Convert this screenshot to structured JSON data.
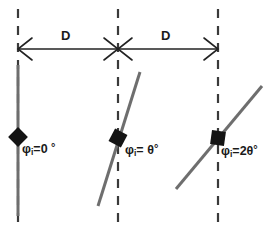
{
  "figure": {
    "background_color": "#ffffff",
    "width": 273,
    "height": 240
  },
  "colors": {
    "dashed_line": "#3a3a3a",
    "sample_line": "#6e6e6e",
    "marker": "#141414",
    "arrow": "#222222",
    "text": "#1a1a1a"
  },
  "dimension_arrows": [
    {
      "name": "left-span",
      "label": "D",
      "x1": 18,
      "x2": 118,
      "y": 49
    },
    {
      "name": "right-span",
      "label": "D",
      "x1": 118,
      "x2": 218,
      "y": 49
    }
  ],
  "reference_lines": [
    {
      "name": "reference-line-left",
      "x": 18
    },
    {
      "name": "reference-line-middle",
      "x": 118
    },
    {
      "name": "reference-line-right",
      "x": 218
    }
  ],
  "samples": [
    {
      "name": "sample-0",
      "symbol": "φ",
      "subscript": "i",
      "equals": "=",
      "value": "0",
      "degree": "°",
      "label_full": "φi=0 °",
      "angle_from_vertical_deg": 0,
      "marker": "diamond",
      "marker_x": 18,
      "marker_y": 137,
      "label_x": 22,
      "label_y": 143
    },
    {
      "name": "sample-theta",
      "symbol": "φ",
      "subscript": "i",
      "equals": "=",
      "value": "θ",
      "degree": "°",
      "label_full": "φi= θ°",
      "angle_from_vertical_deg": 17,
      "marker": "diamond",
      "marker_x": 118,
      "marker_y": 138,
      "label_x": 125,
      "label_y": 144
    },
    {
      "name": "sample-2theta",
      "symbol": "φ",
      "subscript": "i",
      "equals": "=",
      "value": "2θ",
      "degree": "°",
      "label_full": "φi=2θ°",
      "angle_from_vertical_deg": 40,
      "marker": "square",
      "marker_x": 218,
      "marker_y": 138,
      "label_x": 221,
      "label_y": 145
    }
  ]
}
